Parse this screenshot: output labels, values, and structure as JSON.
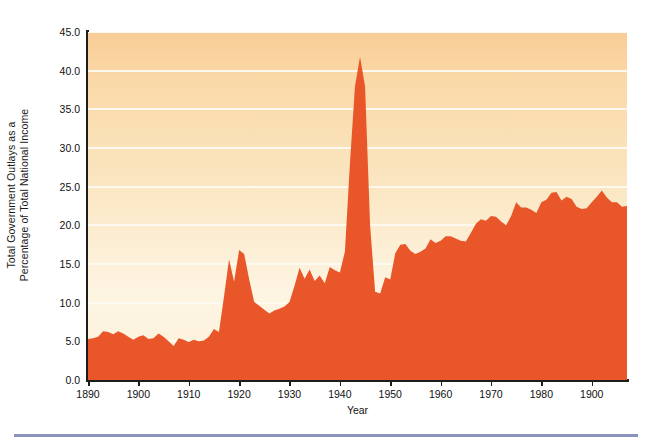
{
  "chart_data": {
    "type": "area",
    "title": "",
    "xlabel": "Year",
    "ylabel": "Total Government Outlays as a Percentage of Total National Income",
    "ylabel_line1": "Total Government Outlays as a",
    "ylabel_line2": "Percentage of Total National Income",
    "xlim": [
      1890,
      1997
    ],
    "ylim": [
      0.0,
      45.0
    ],
    "grid": true,
    "legend": "none",
    "series_name": "Total Government Outlays as a Percentage of Total National Income",
    "fill_color": "#e8562a",
    "background_top_color": "#f8cc96",
    "background_bottom_color": "#fdf2de",
    "gridline_color": "#fdfaf2",
    "axis_color": "#1d1d1b",
    "yticks": [
      "0.0",
      "5.0",
      "10.0",
      "15.0",
      "20.0",
      "25.0",
      "30.0",
      "35.0",
      "40.0",
      "45.0"
    ],
    "ytick_values": [
      0.0,
      5.0,
      10.0,
      15.0,
      20.0,
      25.0,
      30.0,
      35.0,
      40.0,
      45.0
    ],
    "xticks": [
      "1890",
      "1900",
      "1910",
      "1920",
      "1930",
      "1940",
      "1950",
      "1960",
      "1970",
      "1980",
      "1900"
    ],
    "xtick_values": [
      1890,
      1900,
      1910,
      1920,
      1930,
      1940,
      1950,
      1960,
      1970,
      1980,
      1990
    ],
    "x": [
      1890,
      1891,
      1892,
      1893,
      1894,
      1895,
      1896,
      1897,
      1898,
      1899,
      1900,
      1901,
      1902,
      1903,
      1904,
      1905,
      1906,
      1907,
      1908,
      1909,
      1910,
      1911,
      1912,
      1913,
      1914,
      1915,
      1916,
      1917,
      1918,
      1919,
      1920,
      1921,
      1922,
      1923,
      1924,
      1925,
      1926,
      1927,
      1928,
      1929,
      1930,
      1931,
      1932,
      1933,
      1934,
      1935,
      1936,
      1937,
      1938,
      1939,
      1940,
      1941,
      1942,
      1943,
      1944,
      1945,
      1946,
      1947,
      1948,
      1949,
      1950,
      1951,
      1952,
      1953,
      1954,
      1955,
      1956,
      1957,
      1958,
      1959,
      1960,
      1961,
      1962,
      1963,
      1964,
      1965,
      1966,
      1967,
      1968,
      1969,
      1970,
      1971,
      1972,
      1973,
      1974,
      1975,
      1976,
      1977,
      1978,
      1979,
      1980,
      1981,
      1982,
      1983,
      1984,
      1985,
      1986,
      1987,
      1988,
      1989,
      1990,
      1991,
      1992,
      1993,
      1994,
      1995,
      1996,
      1997
    ],
    "values": [
      5.3,
      5.4,
      5.6,
      6.3,
      6.2,
      5.9,
      6.3,
      6.0,
      5.6,
      5.2,
      5.6,
      5.8,
      5.3,
      5.4,
      6.0,
      5.6,
      5.0,
      4.4,
      5.4,
      5.2,
      4.9,
      5.2,
      5.0,
      5.1,
      5.6,
      6.6,
      6.2,
      10.8,
      15.6,
      12.7,
      16.8,
      16.3,
      13.0,
      10.1,
      9.6,
      9.1,
      8.6,
      9.0,
      9.2,
      9.5,
      10.1,
      12.2,
      14.5,
      13.1,
      14.3,
      12.8,
      13.5,
      12.5,
      14.6,
      14.2,
      13.9,
      16.6,
      28.0,
      38.0,
      41.8,
      38.0,
      20.0,
      11.4,
      11.2,
      13.3,
      13.0,
      16.4,
      17.5,
      17.6,
      16.7,
      16.3,
      16.6,
      17.0,
      18.2,
      17.7,
      18.0,
      18.6,
      18.6,
      18.3,
      18.0,
      17.9,
      19.0,
      20.2,
      20.8,
      20.6,
      21.2,
      21.1,
      20.5,
      20.0,
      21.2,
      23.0,
      22.3,
      22.3,
      22.0,
      21.6,
      23.0,
      23.3,
      24.2,
      24.3,
      23.2,
      23.7,
      23.4,
      22.4,
      22.1,
      22.2,
      23.0,
      23.7,
      24.5,
      23.6,
      23.0,
      23.0,
      22.4,
      22.5
    ]
  },
  "footer": {
    "rule_color": "#8a93bd"
  }
}
